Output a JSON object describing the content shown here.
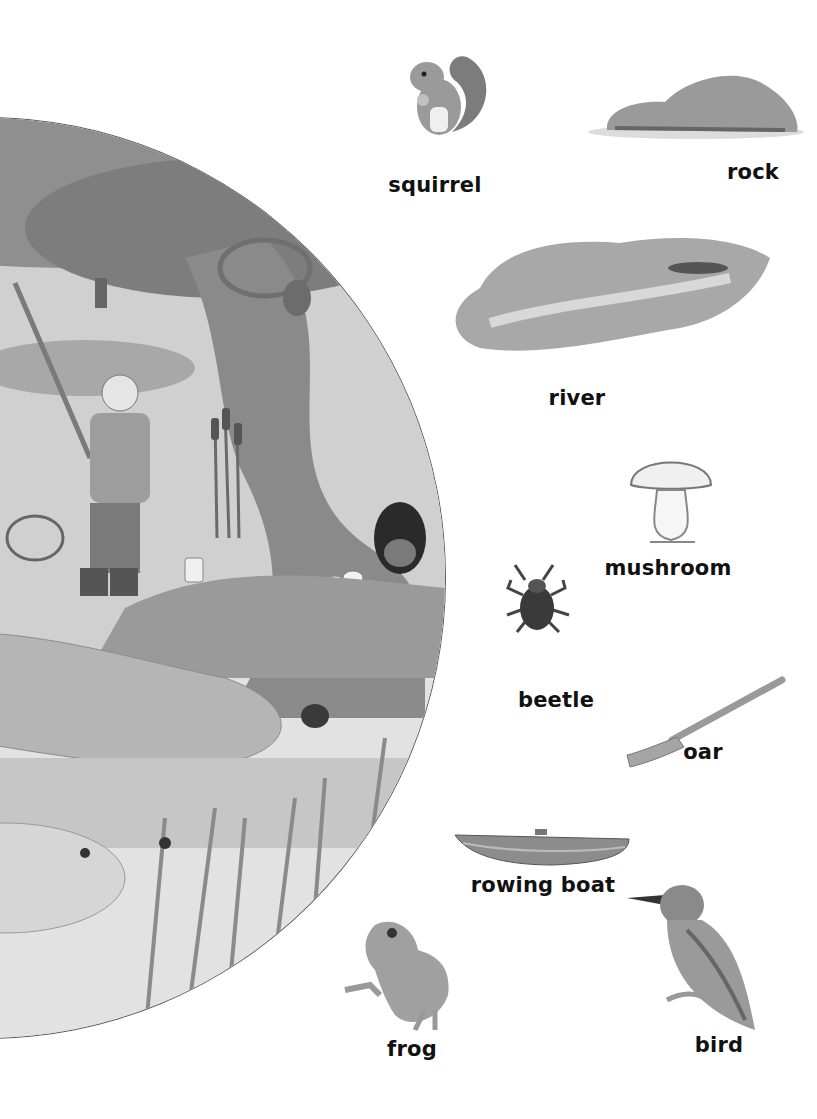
{
  "scene": {
    "description": "Watercolour woodland riverbank scene in a circle: child fishing with a net, tree trunk with squirrel and rabbit, mushrooms, rocks, reeds, beetle, insects"
  },
  "vocabulary": [
    {
      "id": "squirrel",
      "label": "squirrel"
    },
    {
      "id": "rock",
      "label": "rock"
    },
    {
      "id": "river",
      "label": "river"
    },
    {
      "id": "mushroom",
      "label": "mushroom"
    },
    {
      "id": "beetle",
      "label": "beetle"
    },
    {
      "id": "oar",
      "label": "oar"
    },
    {
      "id": "rowing-boat",
      "label": "rowing boat"
    },
    {
      "id": "frog",
      "label": "frog"
    },
    {
      "id": "bird",
      "label": "bird"
    }
  ],
  "colors": {
    "background": "#ffffff",
    "label_text": "#111111",
    "illustration_gray": "#8a8a8a"
  }
}
